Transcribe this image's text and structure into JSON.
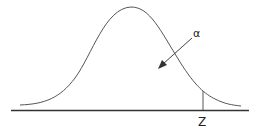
{
  "diagram": {
    "type": "normal-distribution-tail",
    "labels": {
      "alpha": "α",
      "z": "Z"
    },
    "colors": {
      "curve": "#444444",
      "baseline": "#333333",
      "arrow": "#333333",
      "text": "#222222"
    }
  }
}
